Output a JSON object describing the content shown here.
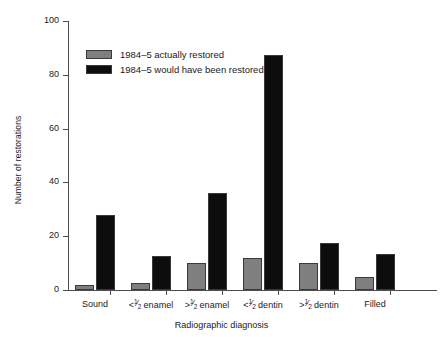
{
  "chart_data": {
    "type": "bar",
    "title": "",
    "xlabel": "Radiographic diagnosis",
    "ylabel": "Number of restorations",
    "ylim": [
      0,
      100
    ],
    "yticks": [
      0,
      20,
      40,
      60,
      80,
      100
    ],
    "ytick_labels": [
      "0",
      "20",
      "40",
      "60",
      "80",
      "100"
    ],
    "grid": false,
    "legend_position": "upper-left-inside",
    "categories": [
      "Sound",
      "<1/2 enamel",
      ">1/2 enamel",
      "<1/2 dentin",
      ">1/2 dentin",
      "Filled"
    ],
    "category_parts": [
      {
        "pre": "Sound",
        "frac_num": "",
        "frac_den": "",
        "post": ""
      },
      {
        "pre": "<",
        "frac_num": "1",
        "frac_den": "2",
        "post": " enamel"
      },
      {
        "pre": ">",
        "frac_num": "1",
        "frac_den": "2",
        "post": " enamel"
      },
      {
        "pre": "<",
        "frac_num": "1",
        "frac_den": "2",
        "post": " dentin"
      },
      {
        "pre": ">",
        "frac_num": "1",
        "frac_den": "2",
        "post": " dentin"
      },
      {
        "pre": "Filled",
        "frac_num": "",
        "frac_den": "",
        "post": ""
      }
    ],
    "series": [
      {
        "name": "1984–5 actually restored",
        "color": "#7f7f7f",
        "values": [
          2,
          2.5,
          10,
          12,
          10,
          5
        ]
      },
      {
        "name": "1984–5 would have been restored",
        "color": "#0d0d0d",
        "values": [
          28,
          12.5,
          36,
          87.5,
          17.5,
          13.5
        ]
      }
    ]
  },
  "axis": {
    "color": "#4d4d4d"
  }
}
